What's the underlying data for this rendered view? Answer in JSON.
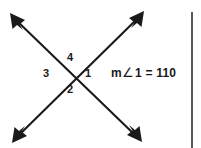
{
  "figure": {
    "name": "intersecting-lines-angle-diagram",
    "background_color": "#ffffff",
    "stroke_color": "#1a1a1a",
    "rule_color": "#59595b",
    "intersection": {
      "x": 76,
      "y": 76
    },
    "lines": [
      {
        "name": "line-nw-se",
        "from": {
          "x": 12,
          "y": 16
        },
        "to": {
          "x": 140,
          "y": 140
        },
        "arrowheads": "both"
      },
      {
        "name": "line-sw-ne",
        "from": {
          "x": 14,
          "y": 140
        },
        "to": {
          "x": 142,
          "y": 14
        },
        "arrowheads": "both"
      }
    ],
    "angle_labels": [
      {
        "id": "4",
        "label": "4",
        "position": "top"
      },
      {
        "id": "3",
        "label": "3",
        "position": "left"
      },
      {
        "id": "1",
        "label": "1",
        "position": "right"
      },
      {
        "id": "2",
        "label": "2",
        "position": "bottom"
      }
    ],
    "annotation": {
      "measure_prefix": "m",
      "angle_symbol": "∠",
      "angle_number": "1",
      "equals": "=",
      "value": "110",
      "full_text": "m∠1 = 110"
    }
  }
}
